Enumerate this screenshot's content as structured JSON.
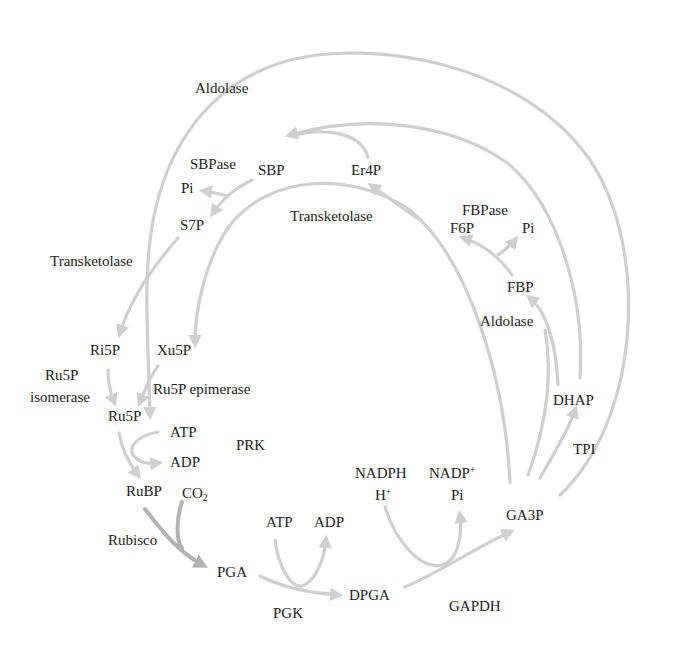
{
  "diagram": {
    "colors": {
      "arrow": "#cfcfcf",
      "arrow_dark": "#b3b3b3",
      "text": "#222222",
      "background": "#ffffff"
    },
    "metabolites": {
      "sbp": "SBP",
      "er4p": "Er4P",
      "s7p": "S7P",
      "pi_sbpase": "Pi",
      "f6p": "F6P",
      "pi_fbpase": "Pi",
      "fbp": "FBP",
      "ri5p": "Ri5P",
      "xu5p": "Xu5P",
      "ru5p": "Ru5P",
      "atp_prk": "ATP",
      "adp_prk": "ADP",
      "rubp": "RuBP",
      "co2_base": "CO",
      "co2_sub": "2",
      "pga": "PGA",
      "atp_pgk": "ATP",
      "adp_pgk": "ADP",
      "dpga": "DPGA",
      "nadph": "NADPH",
      "h_base": "H",
      "h_sup": "+",
      "nadp_base": "NADP",
      "nadp_sup": "+",
      "pi_gapdh": "Pi",
      "ga3p": "GA3P",
      "dhap": "DHAP"
    },
    "enzymes": {
      "aldolase_top": "Aldolase",
      "sbpase": "SBPase",
      "transketolase_mid": "Transketolase",
      "fbpase": "FBPase",
      "transketolase_left": "Transketolase",
      "aldolase_right": "Aldolase",
      "ru5p_isomerase_line1": "Ru5P",
      "ru5p_isomerase_line2": "isomerase",
      "ru5p_epimerase": "Ru5P epimerase",
      "prk": "PRK",
      "rubisco": "Rubisco",
      "pgk": "PGK",
      "gapdh": "GAPDH",
      "tpi": "TPI"
    }
  }
}
